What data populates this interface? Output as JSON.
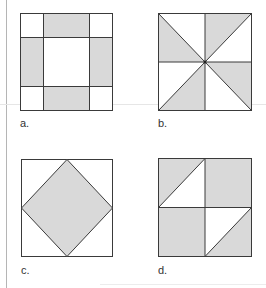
{
  "figures": [
    {
      "id": "a",
      "label": "a.",
      "pattern": "four-patch border with white center and white corners, gray edge rectangles"
    },
    {
      "id": "b",
      "label": "b.",
      "pattern": "pinwheel of eight triangles, alternating gray and white"
    },
    {
      "id": "c",
      "label": "c.",
      "pattern": "gray diamond inscribed in a white square"
    },
    {
      "id": "d",
      "label": "d.",
      "pattern": "2x2 grid with half-square triangles in top-left and bottom-right quadrants"
    }
  ],
  "colors": {
    "fill": "#d9d9d9",
    "stroke": "#3a3a3a",
    "background": "#ffffff"
  }
}
